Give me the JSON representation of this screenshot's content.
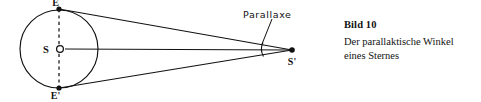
{
  "figure": {
    "name": "parallax-diagram",
    "stroke_color": "#111111",
    "dash_color": "#3a3a3a",
    "labels": {
      "earth_top": "E",
      "earth_bottom": "E'",
      "sun": "S",
      "star": "S'",
      "angle": "Parallaxe"
    },
    "points": {
      "sun_center": {
        "x": 59,
        "y": 49
      },
      "earth_top": {
        "x": 59,
        "y": 9
      },
      "earth_bottom": {
        "x": 59,
        "y": 88
      },
      "star": {
        "x": 292,
        "y": 50
      }
    },
    "orbit_radius": 39,
    "icons": {
      "sun_marker": "sun-open-circle-icon",
      "earth_top_marker": "filled-dot-icon",
      "earth_bottom_marker": "filled-dot-icon",
      "star_marker": "filled-dot-icon",
      "angle_marker": "angle-arc-icon",
      "orbit_axis": "dashed-axis-icon"
    }
  },
  "caption": {
    "title": "Bild 10",
    "line1": "Der parallaktische Winkel",
    "line2": "eines Sternes"
  }
}
